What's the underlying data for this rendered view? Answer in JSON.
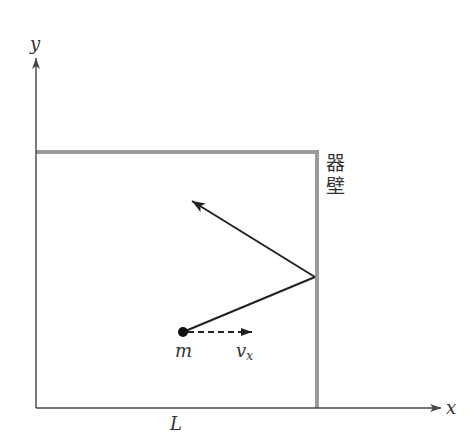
{
  "diagram": {
    "axes": {
      "x_label": "x",
      "y_label": "y"
    },
    "container": {
      "wall_label_line1": "器",
      "wall_label_line2": "壁",
      "width_label": "L"
    },
    "particle": {
      "mass_label": "m",
      "velocity_label_main": "v",
      "velocity_label_sub": "x"
    },
    "colors": {
      "axis": "#444444",
      "wall": "#9a9a9a",
      "trajectory": "#222222",
      "particle": "#111111",
      "text": "#333333"
    }
  }
}
